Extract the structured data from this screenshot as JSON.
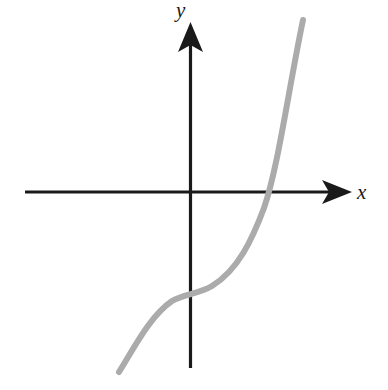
{
  "figure": {
    "background_color": "#ffffff",
    "width": 388,
    "height": 390
  },
  "axes": {
    "x_label": "x",
    "y_label": "y",
    "axis_color": "#1a1a1a",
    "origin": {
      "x": 190,
      "y": 192
    },
    "x_axis": {
      "start_x": 25,
      "end_x": 352,
      "y": 192,
      "arrow": "right"
    },
    "y_axis": {
      "x": 190,
      "start_y": 368,
      "end_y": 22,
      "arrow": "up"
    }
  },
  "curve": {
    "name": "cubic-curve",
    "color": "#ababab",
    "stroke_width": 6,
    "description": "Increasing cubic with a flat (horizontal) inflection point left of the y-axis",
    "path": "M 119 372 C 134 348 150 316 172 301 C 183 294 199 294 212 286 C 238 270 252 240 264 208 C 278 168 288 92 303 20"
  },
  "chart_data": {
    "type": "line",
    "title": "",
    "xlabel": "x",
    "ylabel": "y",
    "grid": false,
    "legend": null,
    "annotations": [],
    "xlim": [
      -2.9,
      2.9
    ],
    "ylim": [
      -2.9,
      2.9
    ],
    "xticks": [],
    "yticks": [],
    "series": [
      {
        "name": "cubic",
        "color": "#ababab",
        "x": [
          -1.25,
          -1.1,
          -0.95,
          -0.8,
          -0.65,
          -0.5,
          -0.35,
          -0.2,
          -0.05,
          0.1,
          0.25,
          0.4,
          0.55,
          0.7,
          0.85,
          1.0,
          1.15,
          1.3,
          1.45,
          1.6,
          1.75,
          1.9,
          2.0
        ],
        "y": [
          -2.72,
          -2.4,
          -2.08,
          -1.82,
          -1.6,
          -1.46,
          -1.38,
          -1.33,
          -1.31,
          -1.3,
          -1.27,
          -1.2,
          -1.05,
          -0.82,
          -0.5,
          -0.1,
          0.4,
          1.0,
          1.68,
          2.45,
          3.3,
          4.2,
          4.85
        ]
      }
    ],
    "curve_features": {
      "inflection_point": {
        "x": 0.0,
        "y": -1.3,
        "pixel": [
          190,
          297
        ]
      },
      "x_intercept": {
        "x": 1.05,
        "y": 0,
        "pixel": [
          270,
          192
        ]
      },
      "y_intercept": {
        "x": 0,
        "y": -1.3,
        "pixel": [
          190,
          297
        ]
      },
      "left_endpoint": {
        "pixel": [
          119,
          372
        ]
      },
      "right_endpoint": {
        "pixel": [
          303,
          20
        ]
      },
      "monotonic": "increasing"
    }
  }
}
